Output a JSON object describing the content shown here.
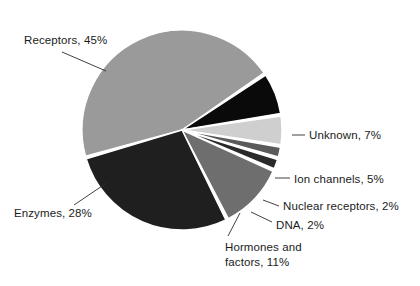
{
  "figure": {
    "background_color": "#ffffff",
    "text_color": "#1b1b1b"
  },
  "chart_data": {
    "type": "pie",
    "title": "",
    "subtitle": "",
    "xlabel": "",
    "ylabel": "",
    "grid": false,
    "legend_position": "none",
    "labels_position": "outside-with-leader-lines",
    "total_percent": 100,
    "categories": [
      "Receptors",
      "Unknown",
      "Ion channels",
      "Nuclear receptors",
      "DNA",
      "Hormones and factors",
      "Enzymes"
    ],
    "values": [
      45,
      7,
      5,
      2,
      2,
      11,
      28
    ],
    "slices": [
      {
        "name": "Receptors",
        "value": 45,
        "label": "Receptors, 45%",
        "color": "#9a9a9a",
        "start_angle_deg": 254.0,
        "end_angle_deg": 416.0
      },
      {
        "name": "Unknown",
        "value": 7,
        "label": "Unknown, 7%",
        "color": "#0a0a0a",
        "start_angle_deg": 56.0,
        "end_angle_deg": 81.2
      },
      {
        "name": "Ion channels",
        "value": 5,
        "label": "Ion channels, 5%",
        "color": "#cfcfcf",
        "start_angle_deg": 81.2,
        "end_angle_deg": 99.2
      },
      {
        "name": "Nuclear receptors",
        "value": 2,
        "label": "Nuclear receptors, 2%",
        "color": "#5a5a5a",
        "start_angle_deg": 99.2,
        "end_angle_deg": 106.4
      },
      {
        "name": "DNA",
        "value": 2,
        "label": "DNA, 2%",
        "color": "#2a2a2a",
        "start_angle_deg": 106.4,
        "end_angle_deg": 113.6
      },
      {
        "name": "Hormones and factors",
        "value": 11,
        "label_line1": "Hormones and",
        "label_line2": "factors, 11%",
        "label": "Hormones and factors, 11%",
        "color": "#6e6e6e",
        "start_angle_deg": 113.6,
        "end_angle_deg": 153.2
      },
      {
        "name": "Enzymes",
        "value": 28,
        "label": "Enzymes, 28%",
        "color": "#1f1f1f",
        "start_angle_deg": 153.2,
        "end_angle_deg": 254.0
      }
    ],
    "geometry": {
      "center_x": 182,
      "center_y": 130,
      "radius": 100,
      "gap_degrees": 1.6,
      "separator_color": "#ffffff"
    }
  },
  "leader_lines": [
    {
      "name": "receptors-leader",
      "x1": 62,
      "y1": 52,
      "x2": 106,
      "y2": 71
    },
    {
      "name": "enzymes-leader",
      "x1": 74,
      "y1": 205,
      "x2": 108,
      "y2": 182
    },
    {
      "name": "unknown-leader",
      "x1": 292,
      "y1": 135,
      "x2": 305,
      "y2": 135
    },
    {
      "name": "ion-leader",
      "x1": 275,
      "y1": 178,
      "x2": 290,
      "y2": 178
    },
    {
      "name": "nuclear-leader",
      "x1": 263,
      "y1": 200,
      "x2": 279,
      "y2": 206
    },
    {
      "name": "dna-leader",
      "x1": 251,
      "y1": 212,
      "x2": 272,
      "y2": 222
    },
    {
      "name": "hormones-leader",
      "x1": 228,
      "y1": 236,
      "x2": 240,
      "y2": 213
    }
  ]
}
